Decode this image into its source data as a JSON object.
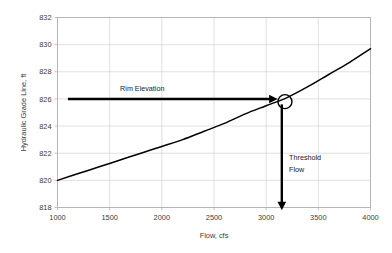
{
  "chart_data": {
    "type": "line",
    "title": "",
    "xlabel": "Flow, cfs",
    "ylabel": "Hydraulic Grade Line, ft",
    "xlim": [
      1000,
      4000
    ],
    "ylim": [
      818,
      832
    ],
    "xticks": [
      1000,
      1500,
      2000,
      2500,
      3000,
      3500,
      4000
    ],
    "yticks": [
      818,
      820,
      822,
      824,
      826,
      828,
      830,
      832
    ],
    "xtick_labels": [
      "1000",
      "1500",
      "2000",
      "2500",
      "3000",
      "3500",
      "4000"
    ],
    "ytick_labels": [
      "818",
      "820",
      "822",
      "824",
      "826",
      "828",
      "830",
      "832"
    ],
    "grid": true,
    "legend": "none",
    "series": [
      {
        "name": "Hydraulic Grade Line",
        "color": "#000000",
        "x": [
          1000,
          1200,
          1400,
          1600,
          1800,
          2000,
          2200,
          2400,
          2600,
          2800,
          3000,
          3200,
          3400,
          3600,
          3800,
          4000
        ],
        "values": [
          820.0,
          820.5,
          821.0,
          821.5,
          822.0,
          822.5,
          823.0,
          823.6,
          824.2,
          824.9,
          825.5,
          826.1,
          826.9,
          827.8,
          828.7,
          829.7
        ]
      }
    ],
    "annotations": [
      {
        "name": "rim-elevation",
        "label": "Rim Elevation",
        "type": "horizontal-arrow",
        "y_value": 826,
        "x_start": 1100,
        "x_end": 3110,
        "label_x": 1600,
        "label_y": 826.6
      },
      {
        "name": "threshold-flow",
        "label_line1": "Threshold",
        "label_line2": "Flow",
        "type": "vertical-arrow",
        "x_value": 3150,
        "y_start": 825.6,
        "y_end": 817.8,
        "label_x": 3220,
        "label_y1": 821.5,
        "label_y2": 820.6
      },
      {
        "name": "intersection-marker",
        "type": "circle",
        "x_value": 3180,
        "y_value": 825.8,
        "radius_px": 7
      }
    ],
    "colors": {
      "curve": "#000000",
      "annotation": "#000000",
      "grid": "#d3d3d3",
      "border": "#b5b5b5",
      "background": "#ffffff",
      "text": "#3b3b3b"
    }
  }
}
